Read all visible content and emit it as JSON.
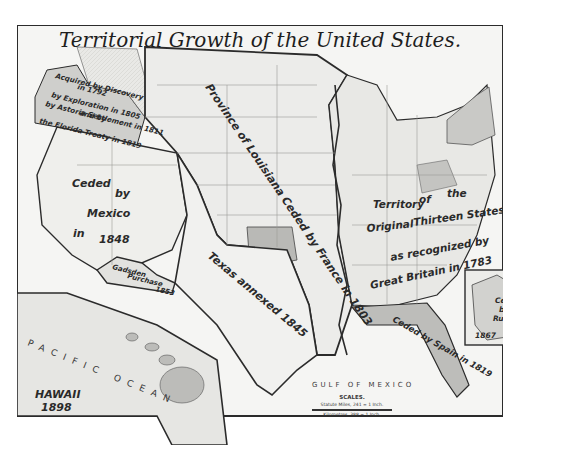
{
  "map": {
    "title": "Territorial Growth of the United States.",
    "regions": [
      {
        "id": "oregon",
        "lines": [
          "Acquired by Discovery",
          "in 1792",
          "by Exploration in 1805",
          "by Astoria Settlement in 1811",
          "and by",
          "the Florida Treaty in 1819"
        ]
      },
      {
        "id": "mexican-cession",
        "lines": [
          "Ceded",
          "by",
          "Mexico",
          "in",
          "1848"
        ]
      },
      {
        "id": "gadsden",
        "lines": [
          "Gadsden",
          "Purchase",
          "1853"
        ]
      },
      {
        "id": "louisiana",
        "text": "Province of Louisiana Ceded by France in 1803"
      },
      {
        "id": "texas",
        "text": "Texas annexed 1845"
      },
      {
        "id": "thirteen-states",
        "lines": [
          "Territory",
          "of",
          "the",
          "Original",
          "Thirteen States",
          "as recognized by",
          "Great Britain in 1783"
        ]
      },
      {
        "id": "florida",
        "text": "Ceded by Spain in 1819"
      },
      {
        "id": "alaska",
        "lines": [
          "Ceded",
          "by",
          "Russia",
          "1867"
        ]
      },
      {
        "id": "hawaii",
        "lines": [
          "HAWAII",
          "1898"
        ]
      }
    ],
    "water": {
      "pacific": "PACIFIC OCEAN",
      "gulf": "GULF OF MEXICO"
    },
    "scales": {
      "heading": "SCALES.",
      "line1": "Statute Miles, 241 = 1 Inch.",
      "line2": "Kilometres, 388 = 1 Inch."
    },
    "colors": {
      "paper": "#f4f4f2",
      "shade": "#c9c9c6",
      "shade_dark": "#a9a9a6",
      "border": "#2b2b2b",
      "ink": "#222222"
    }
  }
}
